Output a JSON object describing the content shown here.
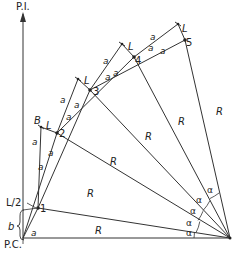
{
  "diagram": {
    "labels": {
      "pi": "P.I.",
      "pc": "P.C.",
      "b": "b",
      "half_l": "L/2",
      "B": "B",
      "L": "L",
      "R": "R",
      "a": "a",
      "alpha": "α"
    },
    "points": [
      {
        "id": "1",
        "label": "1"
      },
      {
        "id": "2",
        "label": "2"
      },
      {
        "id": "3",
        "label": "3"
      },
      {
        "id": "4",
        "label": "4"
      },
      {
        "id": "5",
        "label": "5"
      }
    ],
    "radius_labels": [
      "R",
      "R",
      "R",
      "R",
      "R",
      "R"
    ],
    "angle_labels": [
      "α",
      "α",
      "α",
      "α",
      "α"
    ],
    "colors": {
      "line": "#333333",
      "text": "#222222",
      "background": "#ffffff"
    }
  }
}
